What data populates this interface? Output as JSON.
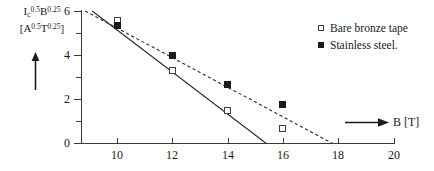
{
  "chart_data": {
    "type": "scatter",
    "title": "",
    "xlabel": "B [T]",
    "ylabel_line1_prefix": "I",
    "ylabel_line1_sub": "c",
    "ylabel_line1_sup1": "0.5",
    "ylabel_line1_mid": "B",
    "ylabel_line1_sup2": "0.25",
    "ylabel_line2_open": "[A",
    "ylabel_line2_sup1": "0.5",
    "ylabel_line2_mid": "T",
    "ylabel_line2_sup2": "0.25",
    "ylabel_line2_close": "]",
    "xlim": [
      8,
      21
    ],
    "ylim": [
      0,
      6
    ],
    "grid": false,
    "legend_position": "top-right",
    "x_ticks": [
      10,
      12,
      14,
      16,
      18,
      20
    ],
    "x_tick_labels": [
      "10",
      "12",
      "14",
      "16",
      "18",
      "20"
    ],
    "x_minor_ticks": [
      11,
      13,
      15,
      17,
      19
    ],
    "y_ticks": [
      0,
      2,
      4,
      6
    ],
    "y_tick_labels": [
      "0",
      "2",
      "4",
      "6"
    ],
    "y_minor_ticks": [
      1,
      3,
      5
    ],
    "series": [
      {
        "name": "Bare bronze tape",
        "marker": "open-square",
        "line_style": "solid",
        "color": "#2b2b2b",
        "x": [
          10,
          12,
          14,
          16
        ],
        "values": [
          5.55,
          3.3,
          1.5,
          0.7
        ],
        "fit_line": {
          "x": [
            9.1,
            15.4
          ],
          "y": [
            6.0,
            0.0
          ]
        }
      },
      {
        "name": "Stainless steel.",
        "marker": "filled-square",
        "line_style": "dashed",
        "color": "#2b2b2b",
        "x": [
          10,
          12,
          14,
          16
        ],
        "values": [
          5.35,
          4.0,
          2.65,
          1.75
        ],
        "fit_line": {
          "x": [
            8.85,
            17.8
          ],
          "y": [
            6.0,
            0.0
          ]
        }
      }
    ]
  },
  "axis_arrows": {
    "y_arrow_name": "y-axis-direction-arrow",
    "x_arrow_name": "x-axis-direction-arrow"
  }
}
